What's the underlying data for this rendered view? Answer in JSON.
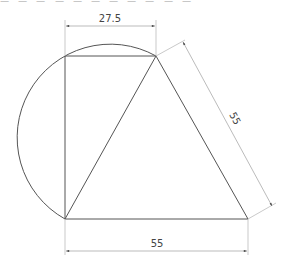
{
  "figure": {
    "top_text_fragment": "ㅡ ㅡ ㅡ ㅡ ㅡ ㅡ ㅡ ㅡ ㅡ ㅡ ㅡ",
    "dimensions": {
      "top_width": "27.5",
      "slant_side": "55",
      "bottom_width": "55"
    },
    "points": {
      "top_left": [
        65,
        56
      ],
      "top_right": [
        156,
        56
      ],
      "bottom_left": [
        65,
        219
      ],
      "bottom_right": [
        248,
        219
      ]
    },
    "colors": {
      "shape_stroke": "#555555",
      "dimension_stroke": "#aaaaaa",
      "label": "#444444"
    }
  }
}
